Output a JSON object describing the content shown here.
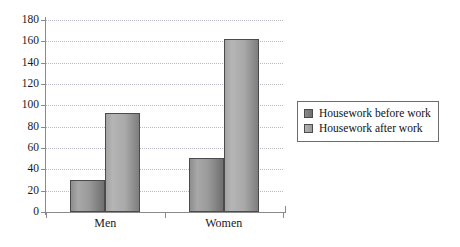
{
  "chart_data": {
    "type": "bar",
    "title": "",
    "xlabel": "",
    "ylabel": "",
    "categories": [
      "Men",
      "Women"
    ],
    "series": [
      {
        "name": "Housework before work",
        "values": [
          30,
          51
        ],
        "color": "#8e8e8e"
      },
      {
        "name": "Housework after work",
        "values": [
          93,
          162
        ],
        "color": "#adadad"
      }
    ],
    "ylim": [
      0,
      180
    ],
    "ytick_labels": [
      "180",
      "160",
      "140",
      "120",
      "100",
      "80",
      "60",
      "40",
      "20",
      "0"
    ],
    "ytick_values": [
      180,
      160,
      140,
      120,
      100,
      80,
      60,
      40,
      20,
      0
    ],
    "ytick_step": 20,
    "grid": true,
    "grid_style": "dotted-horizontal",
    "legend_position": "right",
    "axis_color": "#8a8a8a",
    "gridline_color": "#b9b9c6",
    "background": "#ffffff"
  },
  "legend": {
    "items": [
      {
        "label": "Housework before work"
      },
      {
        "label": "Housework after work"
      }
    ]
  },
  "axis": {
    "x_categories": [
      {
        "label": "Men"
      },
      {
        "label": "Women"
      }
    ]
  }
}
